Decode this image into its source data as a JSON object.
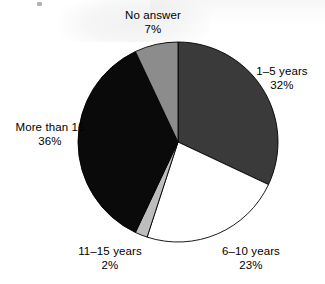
{
  "chart_data": {
    "type": "pie",
    "title": "",
    "subtitle": "",
    "xlabel": "",
    "ylabel": "",
    "legend_position": "none",
    "grid": false,
    "units": "percent",
    "start_angle_deg": 0,
    "direction": "clockwise",
    "categories": [
      "1–5 years",
      "6–10 years",
      "11–15 years",
      "More than 16",
      "No answer"
    ],
    "values": [
      32,
      23,
      2,
      36,
      7
    ],
    "value_labels": [
      "32%",
      "23%",
      "2%",
      "36%",
      "7%"
    ],
    "colors": [
      "#3a3a3a",
      "#ffffff",
      "#bdbdbd",
      "#0a0a0a",
      "#8c8c8c"
    ],
    "slices": [
      {
        "id": "slice-1-5-years",
        "label": "1–5 years",
        "value": 32,
        "value_label": "32%",
        "color": "#3a3a3a",
        "start_deg": 0,
        "end_deg": 115.2
      },
      {
        "id": "slice-6-10-years",
        "label": "6–10 years",
        "value": 23,
        "value_label": "23%",
        "color": "#ffffff",
        "start_deg": 115.2,
        "end_deg": 198.0
      },
      {
        "id": "slice-11-15-years",
        "label": "11–15 years",
        "value": 2,
        "value_label": "2%",
        "color": "#bdbdbd",
        "start_deg": 198.0,
        "end_deg": 205.2
      },
      {
        "id": "slice-more-than-16",
        "label": "More than 16",
        "value": 36,
        "value_label": "36%",
        "color": "#0a0a0a",
        "start_deg": 205.2,
        "end_deg": 334.8
      },
      {
        "id": "slice-no-answer",
        "label": "No answer",
        "value": 7,
        "value_label": "7%",
        "color": "#8c8c8c",
        "start_deg": 334.8,
        "end_deg": 360.0
      }
    ]
  },
  "labels": {
    "no_answer": {
      "name": "No answer",
      "pct": "7%"
    },
    "years_1_5": {
      "name": "1–5 years",
      "pct": "32%"
    },
    "years_6_10": {
      "name": "6–10 years",
      "pct": "23%"
    },
    "years_11_15": {
      "name": "11–15 years",
      "pct": "2%"
    },
    "more_than_16": {
      "name": "More than 16",
      "pct": "36%"
    }
  },
  "geometry": {
    "center_x": 178,
    "center_y": 142,
    "radius": 100
  },
  "style": {
    "stroke": "#000000",
    "stroke_width": 0.9,
    "background": "#ffffff"
  }
}
